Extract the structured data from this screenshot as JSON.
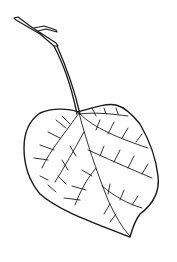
{
  "image": {
    "subject": "leaf line drawing",
    "background": "#ffffff",
    "stroke": "#1a1a1a"
  }
}
